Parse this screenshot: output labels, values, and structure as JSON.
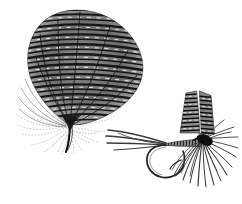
{
  "illustration": {
    "title": "Barred feather and tied artificial fly",
    "style": "monochrome engraving / halftone line drawing",
    "background_color": "#ffffff",
    "ink_color": "#1a1a1a",
    "mid_tone_color": "#5a5a5a",
    "light_tone_color": "#9a9a9a",
    "canvas": {
      "width": 242,
      "height": 204
    }
  },
  "figures": [
    {
      "id": "feather",
      "name": "barred-game-feather",
      "label": "Barred feather",
      "position": {
        "x": 8,
        "y": 6,
        "width": 140,
        "height": 145
      },
      "description": "Fan-shaped mottled feather with horizontal barring, radiating quill veins converging to a dark pointed stem, wispy fluff barbs at lower left",
      "parts": [
        {
          "name": "feather-vane",
          "label": "Vane"
        },
        {
          "name": "feather-barring",
          "label": "Barring"
        },
        {
          "name": "feather-quill",
          "label": "Quill"
        },
        {
          "name": "feather-fluff",
          "label": "Fluff barbs"
        }
      ],
      "bar_count": 26,
      "vein_count": 7
    },
    {
      "id": "fly",
      "name": "tied-artificial-fly",
      "label": "Artificial fly",
      "position": {
        "x": 104,
        "y": 84,
        "width": 134,
        "height": 116
      },
      "description": "Wet fly dressed on a down-eye hook: three swept tail fibres, ribbed tapering body, splayed hackle, paired barred wing slips",
      "parts": [
        {
          "name": "fly-tail",
          "label": "Tail"
        },
        {
          "name": "fly-hook",
          "label": "Hook"
        },
        {
          "name": "fly-barb",
          "label": "Barb"
        },
        {
          "name": "fly-body",
          "label": "Body"
        },
        {
          "name": "fly-hackle",
          "label": "Hackle"
        },
        {
          "name": "fly-wing",
          "label": "Wings"
        },
        {
          "name": "fly-head",
          "label": "Head"
        }
      ],
      "tail_fibre_count": 4,
      "hackle_fibre_count": 22,
      "wing_slip_count": 2,
      "body_segment_count": 11
    }
  ]
}
